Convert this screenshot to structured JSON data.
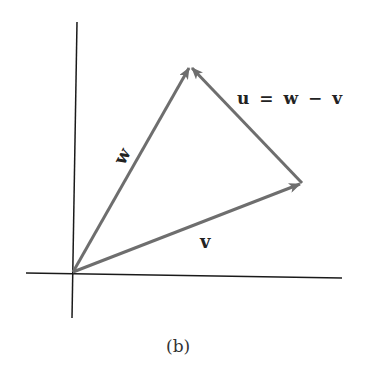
{
  "figure": {
    "caption": "(b)",
    "labels": {
      "w": "w",
      "v": "v",
      "u_eq": "u = w − v"
    },
    "colors": {
      "axis": "#1a1a1a",
      "vector": "#6e6e6e",
      "text": "#222222"
    },
    "points": {
      "origin": [
        72,
        273
      ],
      "w_tip": [
        190,
        66
      ],
      "v_tip": [
        302,
        183
      ]
    }
  }
}
